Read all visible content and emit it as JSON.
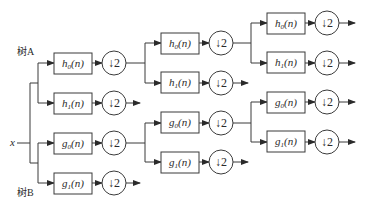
{
  "diagram": {
    "type": "wavelet-packet-filter-bank",
    "input_label": "x",
    "tree_a_label": "树A",
    "tree_b_label": "树B",
    "downsample_label": "↓2",
    "level1": [
      {
        "id": "A-h0",
        "filter": "h",
        "sub": "0",
        "arg": "(n)"
      },
      {
        "id": "A-h1",
        "filter": "h",
        "sub": "1",
        "arg": "(n)"
      },
      {
        "id": "B-g0",
        "filter": "g",
        "sub": "0",
        "arg": "(n)"
      },
      {
        "id": "B-g1",
        "filter": "g",
        "sub": "1",
        "arg": "(n)"
      }
    ],
    "level2": [
      {
        "id": "A-h0-h0",
        "filter": "h",
        "sub": "0",
        "arg": "(n)"
      },
      {
        "id": "A-h0-h1",
        "filter": "h",
        "sub": "1",
        "arg": "(n)"
      },
      {
        "id": "B-g0-g0",
        "filter": "g",
        "sub": "0",
        "arg": "(n)"
      },
      {
        "id": "B-g0-g1",
        "filter": "g",
        "sub": "1",
        "arg": "(n)"
      }
    ],
    "level3": [
      {
        "id": "A-h0-h0-h0",
        "filter": "h",
        "sub": "0",
        "arg": "(n)"
      },
      {
        "id": "A-h0-h0-h1",
        "filter": "h",
        "sub": "1",
        "arg": "(n)"
      },
      {
        "id": "B-g0-g0-g0",
        "filter": "g",
        "sub": "0",
        "arg": "(n)"
      },
      {
        "id": "B-g0-g0-g1",
        "filter": "g",
        "sub": "1",
        "arg": "(n)"
      }
    ]
  }
}
